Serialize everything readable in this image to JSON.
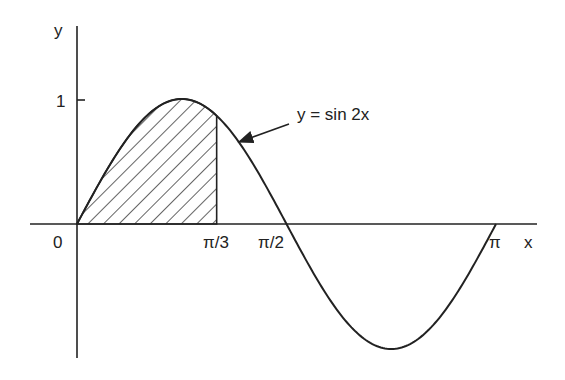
{
  "chart_data": {
    "type": "line",
    "title": "",
    "xlabel": "x",
    "ylabel": "y",
    "series": [
      {
        "name": "y = sin 2x",
        "function": "sin(2x)",
        "x_range": [
          0,
          3.14159
        ]
      }
    ],
    "x_ticks": [
      {
        "value": 0,
        "label": "0"
      },
      {
        "value": 1.0472,
        "label": "π/3"
      },
      {
        "value": 1.5708,
        "label": "π/2"
      },
      {
        "value": 3.14159,
        "label": "π"
      }
    ],
    "y_ticks": [
      {
        "value": 1,
        "label": "1"
      }
    ],
    "shaded_region": {
      "from": 0,
      "to": 1.0472,
      "pattern": "diagonal-hatch",
      "description": "area under y = sin 2x from 0 to π/3"
    },
    "annotations": [
      {
        "text": "y = sin 2x",
        "arrow_to_x": 1.18
      }
    ],
    "grid": false,
    "legend": "none",
    "xlim": [
      -0.35,
      3.46
    ],
    "ylim": [
      -1.07,
      1.58
    ]
  },
  "labels": {
    "x_axis": "x",
    "y_axis": "y",
    "origin": "0",
    "tick_pi3": "π/3",
    "tick_pi2": "π/2",
    "tick_pi": "π",
    "tick_one": "1",
    "curve": "y = sin 2x"
  }
}
